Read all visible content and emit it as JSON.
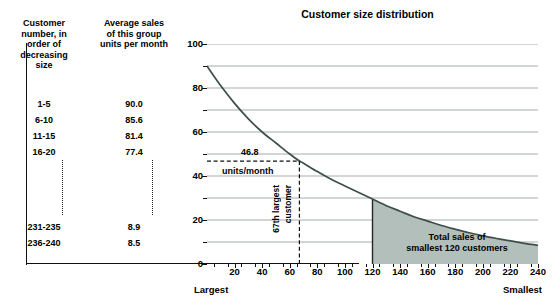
{
  "table": {
    "headers": [
      "Customer number, in order of decreasing size",
      "Average sales of this group units per month"
    ],
    "header_col1_lines": [
      "Customer",
      "number, in",
      "order of",
      "decreasing",
      "size"
    ],
    "header_col2_lines": [
      "Average sales",
      "of this group",
      "units per month"
    ],
    "rows_top": [
      {
        "range": "1-5",
        "value": "90.0"
      },
      {
        "range": "6-10",
        "value": "85.6"
      },
      {
        "range": "11-15",
        "value": "81.4"
      },
      {
        "range": "16-20",
        "value": "77.4"
      }
    ],
    "rows_bottom": [
      {
        "range": "231-235",
        "value": "8.9"
      },
      {
        "range": "236-240",
        "value": "8.5"
      }
    ]
  },
  "annotations": {
    "threshold_value": "46.8",
    "threshold_units": "units/month",
    "customer_marker_line1": "67th largest",
    "customer_marker_line2": "customer",
    "area_label_line1": "Total sales of",
    "area_label_line2": "smallest 120 customers"
  },
  "axis_end_labels": {
    "left": "Largest",
    "right": "Smallest"
  },
  "colors": {
    "curve": "#3d4f4a",
    "area_fill": "#b2bfba",
    "gridline": "#9aa3a0",
    "axis": "#111111",
    "text": "#000000"
  },
  "chart_data": {
    "type": "line",
    "title": "Customer size distribution",
    "xlabel": "",
    "ylabel": "",
    "xlim": [
      0,
      240
    ],
    "ylim": [
      0,
      100
    ],
    "xticks": [
      20,
      40,
      60,
      80,
      100,
      120,
      140,
      160,
      180,
      200,
      220,
      240
    ],
    "yticks": [
      0,
      20,
      40,
      60,
      80,
      100
    ],
    "yticks_minor": [
      10,
      30,
      50,
      70,
      90
    ],
    "grid": true,
    "grid_spacing": 10,
    "legend": "none",
    "x": [
      0,
      10,
      20,
      30,
      40,
      50,
      60,
      67,
      70,
      80,
      90,
      100,
      110,
      120,
      130,
      140,
      150,
      160,
      170,
      180,
      190,
      200,
      210,
      220,
      230,
      240
    ],
    "values": [
      90.0,
      81.0,
      73.0,
      66.0,
      60.0,
      55.0,
      50.0,
      46.8,
      45.8,
      42.0,
      38.5,
      35.5,
      32.5,
      29.5,
      26.5,
      24.0,
      21.5,
      19.5,
      17.5,
      15.8,
      14.2,
      12.8,
      11.6,
      10.5,
      9.4,
      8.5
    ],
    "annotations": [
      {
        "type": "hline",
        "y": 46.8,
        "x_from": 0,
        "x_to": 67,
        "style": "dashed",
        "label": "46.8 units/month"
      },
      {
        "type": "vline",
        "x": 67,
        "y_from": 0,
        "y_to": 46.8,
        "style": "dashed",
        "label": "67th largest customer"
      },
      {
        "type": "area",
        "x_from": 120,
        "x_to": 240,
        "label": "Total sales of smallest 120 customers"
      }
    ]
  }
}
